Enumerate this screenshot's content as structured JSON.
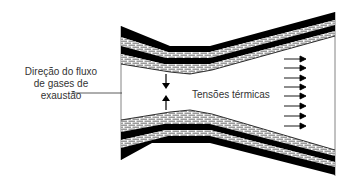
{
  "diagram": {
    "type": "nozzle cross-section with refractory lining",
    "labels": {
      "flow_direction": [
        "Direção do fluxo",
        "de gases de",
        "exaustão"
      ],
      "thermal_stress": "Tensões térmicas"
    },
    "elements": {
      "outflow_arrows_count": 8,
      "compression_arrows": [
        "down",
        "up"
      ],
      "layers": [
        "black shell",
        "brick layer",
        "black shell",
        "brick layer"
      ]
    },
    "colors": {
      "shell": "#000000",
      "brick_mortar": "#ffffff",
      "brick_fill": "#bdbdbd",
      "text": "#333333",
      "line": "#555555"
    }
  }
}
